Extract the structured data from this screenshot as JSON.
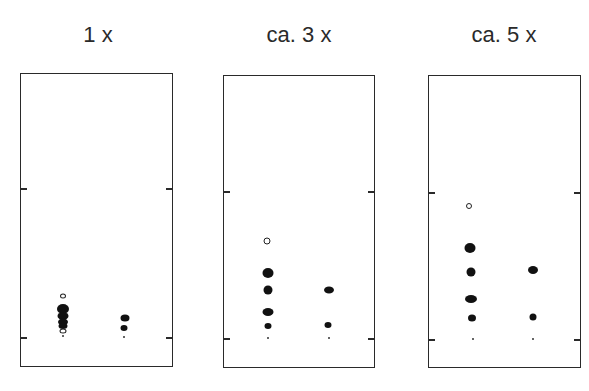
{
  "panels": [
    {
      "title": "1 x",
      "plate": {
        "left": 20,
        "top": 73,
        "width": 153,
        "height": 294
      },
      "ticks_y": [
        188,
        337
      ],
      "origins": [
        {
          "x": 63,
          "y": 336
        },
        {
          "x": 124,
          "y": 337
        }
      ],
      "spots": [
        {
          "lane": 1,
          "x": 63,
          "y": 296,
          "w": 6,
          "h": 5,
          "type": "open"
        },
        {
          "lane": 1,
          "x": 63,
          "y": 309,
          "w": 12,
          "h": 10,
          "type": "filled"
        },
        {
          "lane": 1,
          "x": 63,
          "y": 316,
          "w": 11,
          "h": 8,
          "type": "filled"
        },
        {
          "lane": 1,
          "x": 63,
          "y": 322,
          "w": 10,
          "h": 7,
          "type": "filled"
        },
        {
          "lane": 1,
          "x": 63,
          "y": 326,
          "w": 9,
          "h": 6,
          "type": "filled"
        },
        {
          "lane": 1,
          "x": 63,
          "y": 331,
          "w": 7,
          "h": 5,
          "type": "open"
        },
        {
          "lane": 2,
          "x": 125,
          "y": 318,
          "w": 9,
          "h": 7,
          "type": "filled"
        },
        {
          "lane": 2,
          "x": 124,
          "y": 328,
          "w": 7,
          "h": 6,
          "type": "filled"
        }
      ]
    },
    {
      "title": "ca. 3 x",
      "plate": {
        "left": 223,
        "top": 75,
        "width": 152,
        "height": 293
      },
      "ticks_y": [
        191,
        338
      ],
      "origins": [
        {
          "x": 268,
          "y": 338
        },
        {
          "x": 329,
          "y": 338
        }
      ],
      "spots": [
        {
          "lane": 1,
          "x": 267,
          "y": 241,
          "w": 7,
          "h": 7,
          "type": "open"
        },
        {
          "lane": 1,
          "x": 268,
          "y": 273,
          "w": 11,
          "h": 10,
          "type": "filled"
        },
        {
          "lane": 1,
          "x": 268,
          "y": 290,
          "w": 9,
          "h": 9,
          "type": "filled"
        },
        {
          "lane": 1,
          "x": 268,
          "y": 312,
          "w": 11,
          "h": 8,
          "type": "filled"
        },
        {
          "lane": 1,
          "x": 268,
          "y": 326,
          "w": 7,
          "h": 6,
          "type": "filled"
        },
        {
          "lane": 2,
          "x": 329,
          "y": 290,
          "w": 10,
          "h": 7,
          "type": "filled"
        },
        {
          "lane": 2,
          "x": 328,
          "y": 325,
          "w": 7,
          "h": 6,
          "type": "filled"
        }
      ]
    },
    {
      "title": "ca. 5 x",
      "plate": {
        "left": 428,
        "top": 75,
        "width": 153,
        "height": 293
      },
      "ticks_y": [
        192,
        339
      ],
      "origins": [
        {
          "x": 473,
          "y": 339
        },
        {
          "x": 533,
          "y": 339
        }
      ],
      "spots": [
        {
          "lane": 1,
          "x": 469,
          "y": 206,
          "w": 6,
          "h": 6,
          "type": "open"
        },
        {
          "lane": 1,
          "x": 470,
          "y": 248,
          "w": 11,
          "h": 10,
          "type": "filled"
        },
        {
          "lane": 1,
          "x": 471,
          "y": 272,
          "w": 9,
          "h": 9,
          "type": "filled"
        },
        {
          "lane": 1,
          "x": 471,
          "y": 299,
          "w": 12,
          "h": 8,
          "type": "filled"
        },
        {
          "lane": 1,
          "x": 472,
          "y": 318,
          "w": 8,
          "h": 7,
          "type": "filled"
        },
        {
          "lane": 2,
          "x": 533,
          "y": 270,
          "w": 10,
          "h": 8,
          "type": "filled"
        },
        {
          "lane": 2,
          "x": 533,
          "y": 317,
          "w": 7,
          "h": 7,
          "type": "filled"
        }
      ]
    }
  ]
}
